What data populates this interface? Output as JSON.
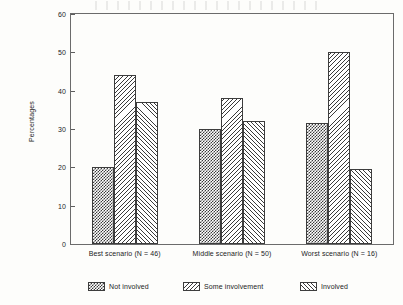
{
  "chart_data": {
    "type": "bar",
    "title": "",
    "xlabel": "",
    "ylabel": "Percentages",
    "ylim": [
      0,
      60
    ],
    "yticks": [
      0,
      10,
      20,
      30,
      40,
      50,
      60
    ],
    "grid": false,
    "legend_position": "bottom",
    "categories": [
      "Best scenario (N = 46)",
      "Middle scenario (N = 50)",
      "Worst scenario (N = 16)"
    ],
    "series": [
      {
        "name": "Not involved",
        "pattern": "checker",
        "values": [
          20,
          30,
          31.5
        ]
      },
      {
        "name": "Some involvement",
        "pattern": "bslash",
        "values": [
          44,
          38,
          50
        ]
      },
      {
        "name": "Involved",
        "pattern": "fslash",
        "values": [
          37,
          32,
          19.5
        ]
      }
    ]
  },
  "axis": {
    "y_title": "Percentages",
    "y_tick_labels": [
      "0",
      "10",
      "20",
      "30",
      "40",
      "50",
      "60"
    ],
    "x_tick_labels": [
      "Best scenario (N = 46)",
      "Middle scenario (N = 50)",
      "Worst scenario (N = 16)"
    ]
  },
  "legend": {
    "entries": [
      {
        "label": "Not involved"
      },
      {
        "label": "Some involvement"
      },
      {
        "label": "Involved"
      }
    ]
  },
  "colors": {
    "ink": "#1c1c1c",
    "frame": "#6b6b6b",
    "bar_outline": "#3d3d3d",
    "hatch": "#3a3a3a",
    "background": "#fdfdfb"
  }
}
